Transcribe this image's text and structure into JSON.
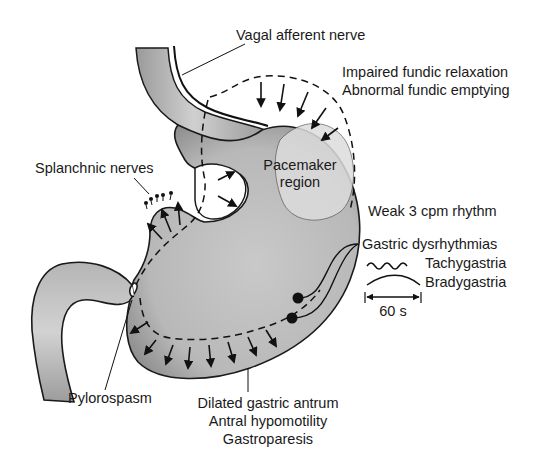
{
  "figure": {
    "type": "anatomical-diagram",
    "colors": {
      "stomach_fill": "#bdbdbd",
      "stomach_shade": "#8e8e8e",
      "pacemaker_fill": "#dcdcdc",
      "outline": "#1a1a1a",
      "background": "#ffffff"
    }
  },
  "labels": {
    "vagal": "Vagal afferent nerve",
    "fundic_1": "Impaired fundic relaxation",
    "fundic_2": "Abnormal fundic emptying",
    "splanchnic": "Splanchnic nerves",
    "pacemaker_1": "Pacemaker",
    "pacemaker_2": "region",
    "weak_rhythm": "Weak 3 cpm rhythm",
    "dysrhythmias": "Gastric dysrhythmias",
    "tachy": "Tachygastria",
    "brady": "Bradygastria",
    "scale": "60 s",
    "pylorospasm": "Pylorospasm",
    "antrum_1": "Dilated gastric antrum",
    "antrum_2": "Antral hypomotility",
    "antrum_3": "Gastroparesis"
  }
}
